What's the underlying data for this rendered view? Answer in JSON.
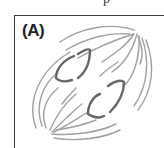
{
  "figure": {
    "panel_label": "(A)",
    "top_fragment_text": "p",
    "colors": {
      "border": "#3a3a3a",
      "spindle_fiber": "#9a9a9a",
      "chromosome": "#666666",
      "label": "#222222"
    }
  }
}
